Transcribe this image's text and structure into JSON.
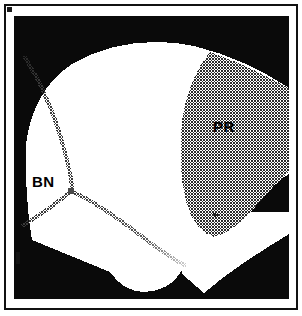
{
  "figure": {
    "type": "micrograph",
    "frame": {
      "outer_border_color": "#111111",
      "background_color": "#ffffff"
    },
    "canvas": {
      "background_color": "#0a0a0a",
      "matrix_color": "#ffffff",
      "stipple_color": "#9a9a9a",
      "boundary_color": "#6e6e6e"
    },
    "labels": [
      {
        "id": "pr",
        "text": "PR",
        "meaning": "precipitate region",
        "color": "#000000"
      },
      {
        "id": "bn",
        "text": "BN",
        "meaning": "boron nitride grain boundary",
        "color": "#000000"
      }
    ],
    "regions": [
      {
        "name": "dark-background",
        "fill": "#0a0a0a",
        "note": "black surround occupying the top band, lower-left triangle and lower-right triangle"
      },
      {
        "name": "bright-matrix-grain",
        "fill": "#ffffff",
        "note": "large white lens-shaped specimen area spanning the centre of the frame"
      },
      {
        "name": "precipitate-region",
        "fill": "stipple",
        "note": "halftone stippled area on the right side of the specimen, labelled PR"
      }
    ],
    "features": [
      {
        "name": "triple-junction",
        "x": 70,
        "y": 190,
        "note": "point where three grain boundary traces meet"
      },
      {
        "name": "upper-boundary-trace",
        "note": "stippled boundary running from the upper-left edge down to the triple junction"
      },
      {
        "name": "lower-left-boundary-trace",
        "note": "stippled boundary running from the triple junction down-left to the specimen edge"
      },
      {
        "name": "lower-right-boundary-trace",
        "note": "stippled boundary fading out to the lower right of the triple junction"
      },
      {
        "name": "bottom-arch-notch",
        "note": "rounded dark arch intruding into the bottom-centre of the specimen"
      }
    ]
  }
}
